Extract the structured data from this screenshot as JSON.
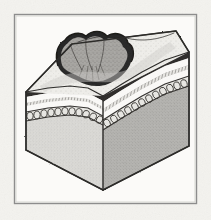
{
  "figure": {
    "title": "Anatomical block diagram of skin cross-section with invasive lesion",
    "domain_note": "halftone-engraving style medical illustration",
    "frame": {
      "name": "thin rectangular rule border",
      "x": 14,
      "y": 14,
      "width": 183,
      "height": 190,
      "stroke": "#8d8d8d",
      "stroke_width": 1.4,
      "fill": "#fbfaf8"
    },
    "background_color": "#f4f3ef",
    "paper_color": "#fbfaf8",
    "ink_color": "#2b2b2b"
  },
  "block": {
    "name": "three-quarter-view cut block of tissue",
    "projection": "oblique isometric",
    "vertices": {
      "top_back_left": [
        72,
        44
      ],
      "top_back_right": [
        176,
        31
      ],
      "top_front_right": [
        189,
        52
      ],
      "top_front_apex": [
        103,
        96
      ],
      "left_front_bottom": [
        26,
        150
      ],
      "center_bottom": [
        103,
        190
      ],
      "right_bottom": [
        189,
        146
      ],
      "left_top_edge": [
        26,
        92
      ]
    },
    "faces": [
      {
        "name": "left-cut-face",
        "fill": "#d8d7d4",
        "shade": "light",
        "description": "left vertical sectioned face of the block"
      },
      {
        "name": "right-cut-face",
        "fill": "#b3b2ae",
        "shade": "mid",
        "description": "right vertical sectioned face of the block, darker"
      },
      {
        "name": "top-surface",
        "fill": "#efeeea",
        "shade": "pale",
        "description": "upper skin surface with fine stipple texture"
      }
    ]
  },
  "layers": [
    {
      "index": 0,
      "name": "epidermis-dark-band",
      "label": "Dark superficial band",
      "color": "#2f2d2b",
      "thickness_px": 5,
      "texture": "solid dark engraving"
    },
    {
      "index": 1,
      "name": "dermis-pale-band",
      "label": "Pale intermediate band",
      "color": "#fbfaf8",
      "thickness_px": 6,
      "texture": "blank white"
    },
    {
      "index": 2,
      "name": "hatched-band",
      "label": "Thin hatched band",
      "color": "#5c5a57",
      "thickness_px": 3,
      "texture": "fine parallel hatching"
    },
    {
      "index": 3,
      "name": "pale-band-two",
      "label": "Second pale band",
      "color": "#fbfaf8",
      "thickness_px": 5,
      "texture": "blank white"
    },
    {
      "index": 4,
      "name": "adipose-bead-chain",
      "label": "Beaded adipose / cellular layer",
      "color": "#3a3836",
      "thickness_px": 9,
      "texture": "chain of rounded cells (loops)"
    },
    {
      "index": 5,
      "name": "subcutaneous-bulk",
      "label": "Deep stippled bulk",
      "color": "#c4c3bf",
      "thickness_px": 95,
      "texture": "uniform stipple"
    }
  ],
  "lesion": {
    "name": "central-invasive-mass",
    "label": "Lobulated mass breaching the surface",
    "fill": "#9b9995",
    "outline": "#232221",
    "lobes": 4,
    "position": {
      "cx": 96,
      "cy": 56
    },
    "width_px": 62,
    "depth_px": 40,
    "description": "dark-rimmed lobulated tumour erupting through the top surface and pressing the layers downward into a trough"
  },
  "annotations": {
    "surface_stipple": "dotted texture across the top plane",
    "trough": "layers deflected downward beneath the lesion",
    "edge_lines": "heavy ink outline along all block silhouette edges"
  }
}
